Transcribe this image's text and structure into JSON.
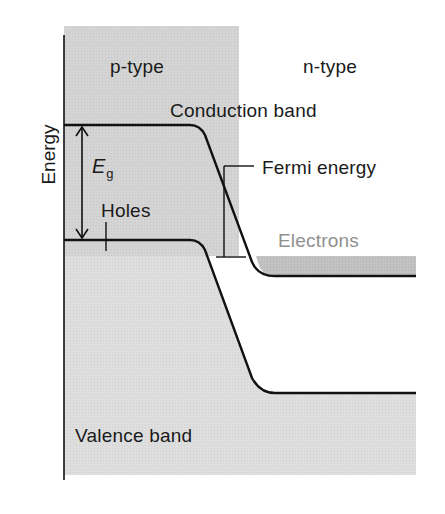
{
  "diagram": {
    "axis": {
      "label": "Energy"
    },
    "regions": {
      "p_type": "p-type",
      "n_type": "n-type"
    },
    "labels": {
      "conduction_band": "Conduction band",
      "valence_band": "Valence band",
      "fermi_energy": "Fermi energy",
      "holes": "Holes",
      "electrons": "Electrons",
      "band_gap_symbol": "E",
      "band_gap_subscript": "g"
    },
    "colors": {
      "p_region_fill": "#d2d2d2",
      "valence_fill": "#dddddd",
      "carrier_fill": "#bdbdbd",
      "line": "#111111",
      "electrons_text": "#8f8f8f"
    }
  }
}
